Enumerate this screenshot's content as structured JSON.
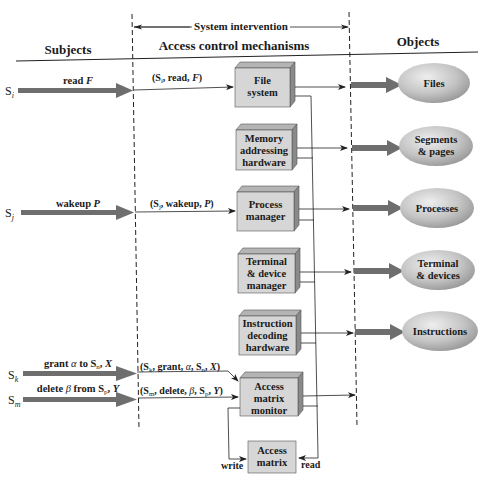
{
  "header": {
    "system_intervention": "System intervention",
    "subjects": "Subjects",
    "mechanisms": "Access control mechanisms",
    "objects": "Objects"
  },
  "subjects": [
    {
      "name": "S",
      "sub": "i",
      "action": "read F",
      "action_prefix": "read ",
      "action_var": "F",
      "message": "(Sᵢ, read, F)"
    },
    {
      "name": "S",
      "sub": "j",
      "action": "wakeup P",
      "action_prefix": "wakeup ",
      "action_var": "P",
      "message": "(Sⱼ, wakeup, P)"
    },
    {
      "name": "S",
      "sub": "k",
      "action": "grant α to Sₙ, X",
      "message": "(Sₖ, grant, α, Sₙ, X)"
    },
    {
      "name": "S",
      "sub": "m",
      "action": "delete β from Sₚ, Y",
      "message": "(Sₘ, delete, β, Sₚ, Y)"
    }
  ],
  "mechanisms": [
    {
      "id": "file-system",
      "lines": [
        "File",
        "system"
      ]
    },
    {
      "id": "memory-addressing-hardware",
      "lines": [
        "Memory",
        "addressing",
        "hardware"
      ]
    },
    {
      "id": "process-manager",
      "lines": [
        "Process",
        "manager"
      ]
    },
    {
      "id": "terminal-device-manager",
      "lines": [
        "Terminal",
        "& device",
        "manager"
      ]
    },
    {
      "id": "instruction-decoding-hardware",
      "lines": [
        "Instruction",
        "decoding",
        "hardware"
      ]
    },
    {
      "id": "access-matrix-monitor",
      "lines": [
        "Access",
        "matrix",
        "monitor"
      ]
    }
  ],
  "access_matrix": {
    "lines": [
      "Access",
      "matrix"
    ],
    "write_label": "write",
    "read_label": "read"
  },
  "objects": [
    {
      "id": "files",
      "lines": [
        "Files"
      ]
    },
    {
      "id": "segments-pages",
      "lines": [
        "Segments",
        "& pages"
      ]
    },
    {
      "id": "processes",
      "lines": [
        "Processes"
      ]
    },
    {
      "id": "terminal-devices",
      "lines": [
        "Terminal",
        "& devices"
      ]
    },
    {
      "id": "instructions",
      "lines": [
        "Instructions"
      ]
    }
  ],
  "colors": {
    "box_face": "#d6d6d6",
    "box_side": "#8a8a8a",
    "box_top": "#b4b4b4",
    "arrow_thick": "#6e6e6e",
    "ellipse_light": "#e6e6e6",
    "ellipse_dark": "#9a9a9a",
    "line": "#222222"
  }
}
